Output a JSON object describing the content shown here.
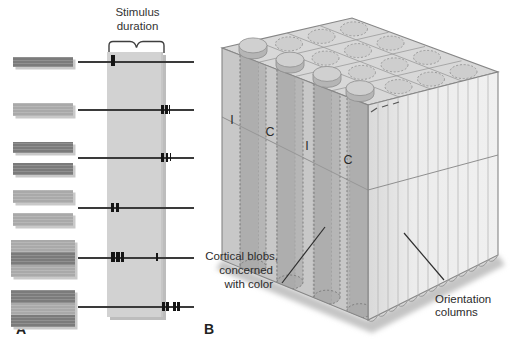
{
  "figure": {
    "colors": {
      "bar_shades": {
        "dark": "#7b7b7b",
        "light": "#a9a9a9"
      },
      "column_fill": "#d2d2d2",
      "line": "#3a3a3a",
      "tick": "#151515",
      "cube_top": "#d8d8d8",
      "cube_front": "#c8c8c8",
      "cube_right_light": "#efefef",
      "cube_right_dark": "#d9d9d9"
    },
    "panel_a": {
      "label": "A",
      "annotation": {
        "line1": "Stimulus",
        "line2": "duration"
      },
      "line_x1": 78,
      "line_x2": 194,
      "rows": [
        {
          "line_y": 62,
          "blocks": [
            {
              "x": 13,
              "y": 57,
              "w": 60,
              "bands": [
                {
                  "h": 10,
                  "shade": "dark"
                }
              ]
            }
          ],
          "ticks": [
            {
              "x": 111,
              "w": 4,
              "h": 11
            }
          ]
        },
        {
          "line_y": 110,
          "blocks": [
            {
              "x": 13,
              "y": 103,
              "w": 60,
              "bands": [
                {
                  "h": 13,
                  "shade": "light"
                }
              ]
            }
          ],
          "ticks": [
            {
              "x": 161,
              "w": 2.5,
              "h": 9
            },
            {
              "x": 165,
              "w": 2.5,
              "h": 9
            },
            {
              "x": 168.5,
              "w": 1.5,
              "h": 9
            }
          ]
        },
        {
          "line_y": 158,
          "blocks": [
            {
              "x": 13,
              "y": 142,
              "w": 60,
              "bands": [
                {
                  "h": 11,
                  "shade": "dark"
                }
              ]
            },
            {
              "x": 13,
              "y": 163,
              "w": 60,
              "bands": [
                {
                  "h": 12,
                  "shade": "dark"
                }
              ]
            }
          ],
          "ticks": [
            {
              "x": 161,
              "w": 3,
              "h": 9
            },
            {
              "x": 165.5,
              "w": 2.5,
              "h": 9
            },
            {
              "x": 169.5,
              "w": 1.5,
              "h": 8
            }
          ]
        },
        {
          "line_y": 208,
          "blocks": [
            {
              "x": 13,
              "y": 190,
              "w": 60,
              "bands": [
                {
                  "h": 13,
                  "shade": "light"
                }
              ]
            },
            {
              "x": 13,
              "y": 213,
              "w": 60,
              "bands": [
                {
                  "h": 13,
                  "shade": "light"
                }
              ]
            }
          ],
          "ticks": [
            {
              "x": 111,
              "w": 3,
              "h": 9
            },
            {
              "x": 115.5,
              "w": 3,
              "h": 9
            }
          ]
        },
        {
          "line_y": 258,
          "blocks": [
            {
              "x": 11,
              "y": 240,
              "w": 64,
              "bands": [
                {
                  "h": 12,
                  "shade": "light"
                },
                {
                  "h": 13,
                  "shade": "dark"
                },
                {
                  "h": 12,
                  "shade": "light"
                }
              ]
            }
          ],
          "ticks": [
            {
              "x": 111,
              "w": 3.5,
              "h": 10
            },
            {
              "x": 116,
              "w": 3.5,
              "h": 10
            },
            {
              "x": 121,
              "w": 3,
              "h": 10
            },
            {
              "x": 156,
              "w": 1.5,
              "h": 8
            }
          ]
        },
        {
          "line_y": 307,
          "blocks": [
            {
              "x": 11,
              "y": 290,
              "w": 64,
              "bands": [
                {
                  "h": 13,
                  "shade": "dark"
                },
                {
                  "h": 12,
                  "shade": "light"
                },
                {
                  "h": 12,
                  "shade": "dark"
                }
              ]
            }
          ],
          "ticks": [
            {
              "x": 162,
              "w": 3,
              "h": 9
            },
            {
              "x": 166,
              "w": 2.5,
              "h": 9
            },
            {
              "x": 173,
              "w": 3,
              "h": 9
            },
            {
              "x": 177,
              "w": 2.5,
              "h": 9
            }
          ]
        }
      ]
    },
    "panel_b": {
      "label": "B",
      "ocular_labels": [
        "I",
        "C",
        "I",
        "C"
      ],
      "blob_label": [
        "Cortical blobs,",
        "concerned",
        "with color"
      ],
      "orientation_label": [
        "Orientation",
        "columns"
      ]
    }
  }
}
